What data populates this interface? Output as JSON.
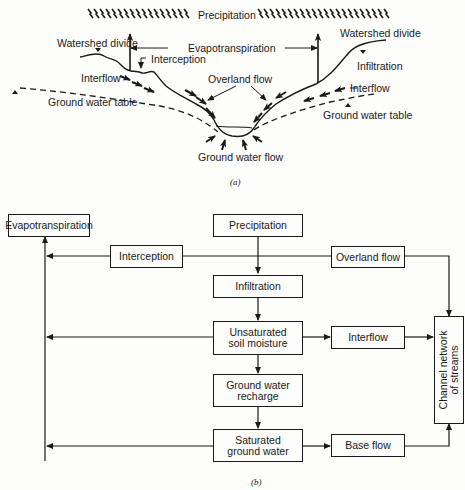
{
  "figure_a": {
    "caption": "(a)",
    "labels": {
      "precipitation": "Precipitation",
      "evapotranspiration": "Evapotranspiration",
      "watershed_divide_left": "Watershed divide",
      "watershed_divide_right": "Watershed divide",
      "interception": "Interception",
      "interflow_left": "Interflow",
      "interflow_right": "Interflow",
      "overland_flow": "Overland flow",
      "infiltration": "Infiltration",
      "ground_water_table_left": "Ground water table",
      "ground_water_table_right": "Ground water table",
      "ground_water_flow": "Ground water flow"
    }
  },
  "figure_b": {
    "caption": "(b)",
    "boxes": {
      "evapotranspiration": "Evapotranspiration",
      "precipitation": "Precipitation",
      "interception": "Interception",
      "overland_flow": "Overland flow",
      "infiltration": "Infiltration",
      "unsaturated_soil_moisture_1": "Unsaturated",
      "unsaturated_soil_moisture_2": "soil moisture",
      "interflow": "Interflow",
      "ground_water_recharge_1": "Ground water",
      "ground_water_recharge_2": "recharge",
      "saturated_ground_water_1": "Saturated",
      "saturated_ground_water_2": "ground water",
      "base_flow": "Base flow",
      "channel_network_1": "Channel network",
      "channel_network_2": "of streams"
    }
  }
}
